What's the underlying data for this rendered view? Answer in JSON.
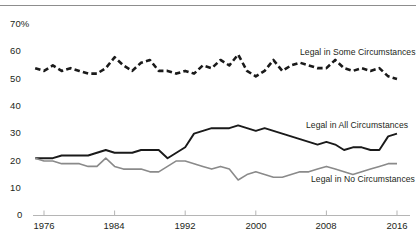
{
  "chart_data": {
    "type": "line",
    "title": "",
    "subtitle": "",
    "xlabel": "",
    "ylabel": "",
    "xlim": [
      1975,
      2016
    ],
    "ylim": [
      0,
      70
    ],
    "grid": false,
    "legend_position": "inline-right",
    "y_ticks": [
      "70%",
      "60",
      "50",
      "40",
      "30",
      "20",
      "10",
      "0"
    ],
    "y_tick_values": [
      70,
      60,
      50,
      40,
      30,
      20,
      10,
      0
    ],
    "x_ticks": [
      "1976",
      "1984",
      "1992",
      "2000",
      "2008",
      "2016"
    ],
    "x_tick_values": [
      1976,
      1984,
      1992,
      2000,
      2008,
      2016
    ],
    "x": [
      1975,
      1976,
      1977,
      1978,
      1979,
      1980,
      1981,
      1982,
      1983,
      1984,
      1985,
      1986,
      1987,
      1988,
      1989,
      1990,
      1991,
      1992,
      1993,
      1994,
      1995,
      1996,
      1997,
      1998,
      1999,
      2000,
      2001,
      2002,
      2003,
      2004,
      2005,
      2006,
      2007,
      2008,
      2009,
      2010,
      2011,
      2012,
      2013,
      2014,
      2015,
      2016
    ],
    "series": [
      {
        "name": "Legal in Some Circumstances",
        "color": "#1a1a1a",
        "style": "dashed",
        "values": [
          54,
          53,
          55,
          53,
          54,
          53,
          52,
          52,
          54,
          58,
          55,
          53,
          56,
          57,
          53,
          53,
          52,
          53,
          52,
          55,
          54,
          57,
          55,
          59,
          53,
          51,
          53,
          57,
          53,
          55,
          56,
          55,
          54,
          54,
          57,
          54,
          53,
          54,
          53,
          54,
          51,
          50
        ]
      },
      {
        "name": "Legal in All Circumstances",
        "color": "#1a1a1a",
        "style": "solid",
        "values": [
          21,
          21,
          21,
          22,
          22,
          22,
          22,
          23,
          24,
          23,
          23,
          23,
          24,
          24,
          24,
          21,
          23,
          25,
          30,
          31,
          32,
          32,
          32,
          33,
          32,
          31,
          32,
          31,
          30,
          29,
          28,
          27,
          26,
          27,
          26,
          24,
          25,
          25,
          24,
          24,
          29,
          30
        ]
      },
      {
        "name": "Legal in No Circumstances",
        "color": "#8a8a8a",
        "style": "solid",
        "values": [
          21,
          20,
          20,
          19,
          19,
          19,
          18,
          18,
          21,
          18,
          17,
          17,
          17,
          16,
          16,
          18,
          20,
          20,
          19,
          18,
          17,
          18,
          17,
          13,
          15,
          16,
          15,
          14,
          14,
          15,
          16,
          16,
          17,
          18,
          17,
          16,
          15,
          16,
          17,
          18,
          19,
          19
        ]
      }
    ]
  }
}
